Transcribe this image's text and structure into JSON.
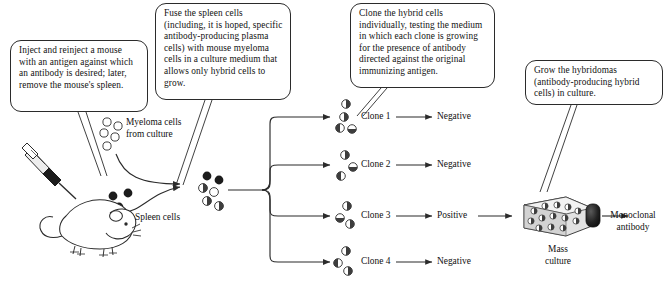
{
  "diagram": {
    "type": "process-flow"
  },
  "callouts": [
    {
      "id": "inject",
      "text": "Inject and reinject a mouse with an antigen against which an antibody is desired; later, remove the mouse's spleen."
    },
    {
      "id": "fuse",
      "text": "Fuse the spleen cells (including, it is hoped, specific antibody-producing plasma cells) with mouse myeloma cells in a culture medium that allows only hybrid cells to grow."
    },
    {
      "id": "clone",
      "text": "Clone the hybrid cells individually, testing the medium in which each clone is growing for the presence of antibody directed against the original immunizing antigen."
    },
    {
      "id": "grow",
      "text": "Grow the hybridomas (antibody-producing hybrid cells) in culture."
    }
  ],
  "labels": {
    "myeloma": "Myeloma cells\nfrom culture",
    "myeloma_line1": "Myeloma cells",
    "myeloma_line2": "from culture",
    "spleen": "Spleen cells",
    "mass_culture_line1": "Mass",
    "mass_culture_line2": "culture",
    "product_line1": "Monoclonal",
    "product_line2": "antibody"
  },
  "clones": [
    {
      "name": "Clone 1",
      "result": "Negative",
      "cells": 4
    },
    {
      "name": "Clone 2",
      "result": "Negative",
      "cells": 3
    },
    {
      "name": "Clone 3",
      "result": "Positive",
      "cells": 3
    },
    {
      "name": "Clone 4",
      "result": "Negative",
      "cells": 3
    }
  ],
  "colors": {
    "stroke": "#2b2b2b",
    "spleen_cell": "#1c1c1c",
    "myeloma_cell": "#ffffff",
    "hybrid_cell": "#4a4a4a",
    "flask_body": "#d8d8d8",
    "flask_cap": "#1e1e1e",
    "text": "#111111"
  }
}
